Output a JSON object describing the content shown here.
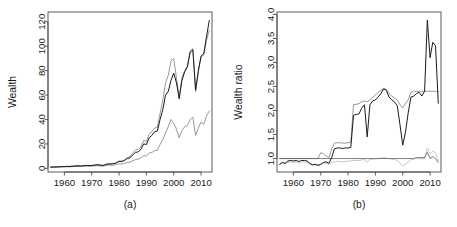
{
  "figure": {
    "background": "#ffffff",
    "panels": [
      "a",
      "b"
    ]
  },
  "panel_a": {
    "caption": "(a)",
    "ylabel": "Wealth",
    "xlabel": ""
  },
  "panel_b": {
    "caption": "(b)",
    "ylabel": "Wealth ratio",
    "xlabel": ""
  },
  "chart_data": [
    {
      "type": "line",
      "panel": "a",
      "title": "",
      "subtitle": "",
      "xlabel": "",
      "ylabel": "Wealth",
      "caption": "(a)",
      "xlim": [
        1954,
        2014
      ],
      "ylim": [
        -3,
        128
      ],
      "xticks": [
        1960,
        1970,
        1980,
        1990,
        2000,
        2010
      ],
      "xticklabels": [
        "1960",
        "1970",
        "1980",
        "1990",
        "2000",
        "2010"
      ],
      "yticks": [
        0,
        20,
        40,
        60,
        80,
        100,
        120
      ],
      "yticklabels": [
        "0",
        "20",
        "40",
        "60",
        "80",
        "100",
        "120"
      ],
      "grid": false,
      "legend": null,
      "legend_position": "none",
      "x": [
        1955,
        1956,
        1957,
        1958,
        1959,
        1960,
        1961,
        1962,
        1963,
        1964,
        1965,
        1966,
        1967,
        1968,
        1969,
        1970,
        1971,
        1972,
        1973,
        1974,
        1975,
        1976,
        1977,
        1978,
        1979,
        1980,
        1981,
        1982,
        1983,
        1984,
        1985,
        1986,
        1987,
        1988,
        1989,
        1990,
        1991,
        1992,
        1993,
        1994,
        1995,
        1996,
        1997,
        1998,
        1999,
        2000,
        2001,
        2002,
        2003,
        2004,
        2005,
        2006,
        2007,
        2008,
        2009,
        2010,
        2011,
        2012,
        2013
      ],
      "series": [
        {
          "name": "strategy-dark",
          "color": "#1a1a1a",
          "width": 1.0,
          "values": [
            1.0,
            1.1,
            1.1,
            1.3,
            1.4,
            1.4,
            1.6,
            1.5,
            1.7,
            1.9,
            2.0,
            1.9,
            2.2,
            2.3,
            2.2,
            2.3,
            2.6,
            2.9,
            2.7,
            2.3,
            3.0,
            3.6,
            3.5,
            3.8,
            4.4,
            5.6,
            5.5,
            6.4,
            8.0,
            8.6,
            11.0,
            13.0,
            13.5,
            15.5,
            20.0,
            19.5,
            25.0,
            27.0,
            30.0,
            30.5,
            40.0,
            48.0,
            60.0,
            63.0,
            72.0,
            78.0,
            70.0,
            57.0,
            72.0,
            79.0,
            83.0,
            95.0,
            97.0,
            64.0,
            80.0,
            92.0,
            94.0,
            108.0,
            121.0
          ]
        },
        {
          "name": "strategy-gray-high",
          "color": "#8c8c8c",
          "width": 0.9,
          "values": [
            1.0,
            1.1,
            1.2,
            1.3,
            1.4,
            1.5,
            1.6,
            1.6,
            1.8,
            2.0,
            2.1,
            2.0,
            2.3,
            2.4,
            2.3,
            2.4,
            2.7,
            3.0,
            2.8,
            2.4,
            3.1,
            3.8,
            3.7,
            4.0,
            4.7,
            6.0,
            6.0,
            7.0,
            9.0,
            9.5,
            12.5,
            15.0,
            15.5,
            17.5,
            23.0,
            22.0,
            28.0,
            30.0,
            33.0,
            33.5,
            45.0,
            56.0,
            70.0,
            76.0,
            88.0,
            90.0,
            74.0,
            58.0,
            74.0,
            80.0,
            84.0,
            96.0,
            98.0,
            63.0,
            79.0,
            91.0,
            93.0,
            105.0,
            113.0
          ]
        },
        {
          "name": "benchmark-gray-low",
          "color": "#8c8c8c",
          "width": 0.9,
          "values": [
            1.0,
            1.0,
            1.0,
            1.1,
            1.2,
            1.2,
            1.3,
            1.2,
            1.4,
            1.5,
            1.6,
            1.5,
            1.7,
            1.8,
            1.7,
            1.8,
            2.0,
            2.2,
            2.0,
            1.7,
            2.2,
            2.6,
            2.5,
            2.6,
            3.0,
            3.6,
            3.5,
            4.0,
            4.8,
            5.0,
            6.2,
            7.2,
            7.5,
            8.5,
            10.5,
            10.0,
            12.5,
            13.0,
            14.5,
            14.8,
            19.5,
            23.5,
            29.0,
            34.0,
            40.0,
            37.0,
            32.0,
            25.0,
            31.0,
            34.0,
            35.0,
            40.0,
            42.0,
            27.0,
            33.0,
            38.0,
            36.0,
            43.0,
            47.0
          ]
        }
      ]
    },
    {
      "type": "line",
      "panel": "b",
      "title": "",
      "subtitle": "",
      "xlabel": "",
      "ylabel": "Wealth ratio",
      "caption": "(b)",
      "xlim": [
        1954,
        2014
      ],
      "ylim": [
        0.72,
        4.05
      ],
      "xticks": [
        1960,
        1970,
        1980,
        1990,
        2000,
        2010
      ],
      "xticklabels": [
        "1960",
        "1970",
        "1980",
        "1990",
        "2000",
        "2010"
      ],
      "yticks": [
        1.0,
        1.5,
        2.0,
        2.5,
        3.0,
        3.5,
        4.0
      ],
      "yticklabels": [
        "1.0",
        "1.5",
        "2.0",
        "2.5",
        "3.0",
        "3.5",
        "4.0"
      ],
      "grid": false,
      "legend": null,
      "legend_position": "none",
      "reference_line": 1.0,
      "x": [
        1955,
        1956,
        1957,
        1958,
        1959,
        1960,
        1961,
        1962,
        1963,
        1964,
        1965,
        1966,
        1967,
        1968,
        1969,
        1970,
        1971,
        1972,
        1973,
        1974,
        1975,
        1976,
        1977,
        1978,
        1979,
        1980,
        1981,
        1982,
        1983,
        1984,
        1985,
        1986,
        1987,
        1988,
        1989,
        1990,
        1991,
        1992,
        1993,
        1994,
        1995,
        1996,
        1997,
        1998,
        1999,
        2000,
        2001,
        2002,
        2003,
        2004,
        2005,
        2006,
        2007,
        2008,
        2009,
        2010,
        2011,
        2012,
        2013
      ],
      "series": [
        {
          "name": "ratio-dark",
          "color": "#1a1a1a",
          "width": 1.0,
          "values": [
            0.88,
            0.92,
            0.9,
            0.95,
            0.96,
            0.95,
            0.96,
            0.94,
            0.96,
            0.96,
            0.95,
            0.9,
            0.87,
            0.88,
            0.86,
            0.88,
            0.92,
            0.93,
            0.9,
            1.02,
            1.2,
            1.22,
            1.22,
            1.21,
            1.22,
            1.22,
            1.23,
            1.9,
            1.92,
            1.93,
            2.05,
            2.12,
            1.45,
            2.12,
            2.2,
            2.22,
            2.28,
            2.35,
            2.45,
            2.42,
            2.28,
            2.22,
            2.18,
            2.1,
            1.7,
            1.28,
            1.55,
            1.95,
            2.28,
            2.3,
            2.35,
            2.38,
            2.3,
            2.4,
            3.88,
            3.1,
            3.42,
            3.35,
            2.15
          ]
        },
        {
          "name": "ratio-gray-upper",
          "color": "#8c8c8c",
          "width": 0.9,
          "values": [
            1.0,
            1.0,
            1.0,
            1.0,
            1.0,
            1.0,
            1.0,
            1.0,
            1.0,
            1.0,
            1.0,
            1.0,
            1.0,
            1.0,
            1.0,
            1.12,
            1.1,
            1.05,
            1.02,
            1.2,
            1.32,
            1.33,
            1.33,
            1.32,
            1.32,
            1.33,
            1.34,
            2.12,
            2.13,
            2.14,
            2.18,
            2.2,
            2.18,
            2.22,
            2.28,
            2.32,
            2.38,
            2.42,
            2.46,
            2.44,
            2.35,
            2.3,
            2.26,
            2.22,
            2.12,
            2.05,
            2.15,
            2.22,
            2.38,
            2.4,
            2.4,
            2.4,
            2.4,
            2.4,
            2.4,
            2.4,
            2.4,
            2.4,
            2.38
          ]
        },
        {
          "name": "ratio-flat-reference",
          "color": "#5a5a5a",
          "width": 0.8,
          "values": [
            1.0,
            1.0,
            1.0,
            1.0,
            1.0,
            1.0,
            1.0,
            1.0,
            1.0,
            1.0,
            1.0,
            1.0,
            1.0,
            1.0,
            1.0,
            1.0,
            1.0,
            1.0,
            1.0,
            1.0,
            1.0,
            1.0,
            1.0,
            1.0,
            1.0,
            1.0,
            1.0,
            1.0,
            1.0,
            1.0,
            1.0,
            1.0,
            1.0,
            1.0,
            1.0,
            1.0,
            1.0,
            1.0,
            1.0,
            1.0,
            1.0,
            1.0,
            1.0,
            1.0,
            1.0,
            1.0,
            1.0,
            1.0,
            1.0,
            1.0,
            1.02,
            1.02,
            1.02,
            1.02,
            1.13,
            1.0,
            1.04,
            1.0,
            0.92
          ]
        },
        {
          "name": "ratio-light-lower",
          "color": "#bfbfbf",
          "width": 0.9,
          "values": [
            0.88,
            0.9,
            0.89,
            0.92,
            0.93,
            0.92,
            0.93,
            0.91,
            0.93,
            0.93,
            0.92,
            0.88,
            0.86,
            0.87,
            0.85,
            0.87,
            0.9,
            0.91,
            0.88,
            0.92,
            0.93,
            0.94,
            0.94,
            0.93,
            0.94,
            0.95,
            0.95,
            0.96,
            0.96,
            0.96,
            0.97,
            0.98,
            0.93,
            0.98,
            0.99,
            0.99,
            1.0,
            1.01,
            1.02,
            1.01,
            1.0,
            0.99,
            0.98,
            0.96,
            0.9,
            0.85,
            0.88,
            0.92,
            0.98,
            0.99,
            1.0,
            1.0,
            0.99,
            1.0,
            1.22,
            1.1,
            1.15,
            1.12,
            0.95
          ]
        }
      ]
    }
  ]
}
